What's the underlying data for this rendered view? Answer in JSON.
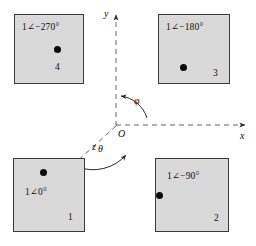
{
  "figure": {
    "type": "phasor-quadrant-diagram",
    "background_color": "#ffffff",
    "box_fill_color": "#d9d9d9",
    "box_border_color": "#3a3a3a",
    "dot_color": "#080808",
    "axis_color": "#555555"
  },
  "axes": {
    "x_label": "x",
    "y_label": "y",
    "z_label": "z",
    "origin_label": "O"
  },
  "angles": {
    "phi_label": "φ",
    "theta_label": "θ"
  },
  "boxes": [
    {
      "index_label": "4",
      "phasor_label": "1∠−270°",
      "quadrant": "top-left"
    },
    {
      "index_label": "3",
      "phasor_label": "1∠−180°",
      "quadrant": "top-right"
    },
    {
      "index_label": "1",
      "phasor_label": "1∠0°",
      "quadrant": "bottom-left"
    },
    {
      "index_label": "2",
      "phasor_label": "1∠−90°",
      "quadrant": "bottom-right"
    }
  ]
}
